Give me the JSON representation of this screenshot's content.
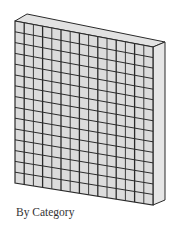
{
  "figure": {
    "caption": "By Category",
    "grid": {
      "columns": 15,
      "rows": 15
    },
    "colors": {
      "face": "#dcdcdc",
      "side": "#e6e6e6",
      "top": "#e2e2e2",
      "line": "#2a2a2a",
      "caption": "#333333"
    }
  }
}
